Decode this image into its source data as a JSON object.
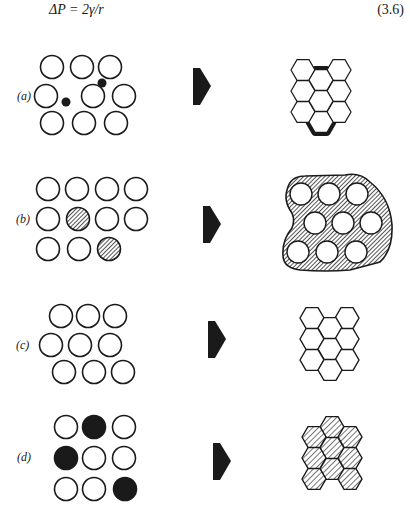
{
  "equation": {
    "text": "ΔP = 2γ/r",
    "number": "(3.6)"
  },
  "panels": [
    {
      "label": "(a)",
      "left": "9 open circles (particles) with 2 small black solid dots in interstices",
      "right": "honeycomb of 10 hexagons with thick black boundaries between central grains"
    },
    {
      "label": "(b)",
      "left": "11 open circles with 2 hatched circles",
      "right": "9 open circles embedded in hatched irregular matrix"
    },
    {
      "label": "(c)",
      "left": "9 open circles in close-packed arrangement",
      "right": "honeycomb of 10 open hexagons"
    },
    {
      "label": "(d)",
      "left": "6 open circles and 3 black solid circles",
      "right": "honeycomb of 10 hatched hexagons"
    }
  ],
  "colors": {
    "ink": "#1a1a1a",
    "background": "#ffffff"
  }
}
